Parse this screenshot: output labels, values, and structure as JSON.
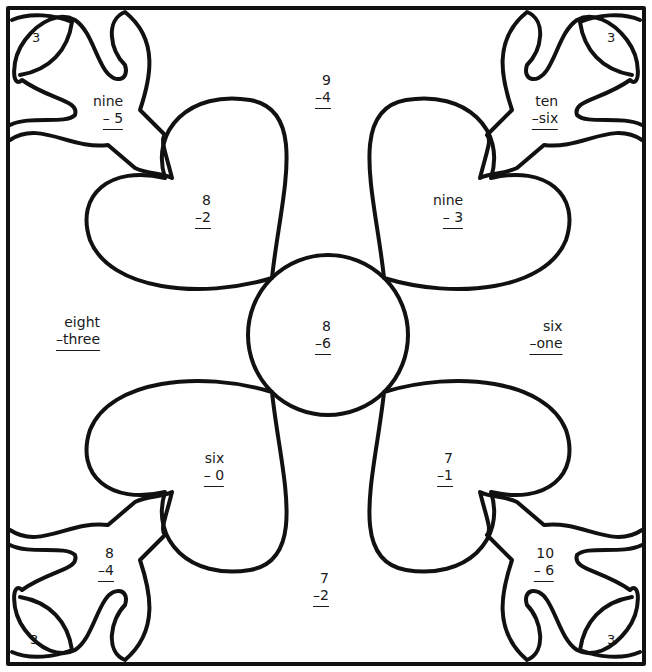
{
  "worksheet": {
    "corner_labels": [
      "3",
      "3",
      "3",
      "3"
    ],
    "problems": {
      "top": {
        "top": "9",
        "bottom": "–4"
      },
      "top_left_heart": {
        "top": "8",
        "bottom": "–2"
      },
      "top_right_heart": {
        "top": "nine",
        "bottom": "–  3"
      },
      "center": {
        "top": "8",
        "bottom": "–6"
      },
      "left": {
        "top": "eight",
        "bottom": "–three"
      },
      "right": {
        "top": "six",
        "bottom": "–one"
      },
      "bottom_left_heart": {
        "top": "six",
        "bottom": "– 0"
      },
      "bottom_right_heart": {
        "top": "7",
        "bottom": "–1"
      },
      "bottom": {
        "top": "7",
        "bottom": "–2"
      },
      "corner_tl": {
        "top": "nine",
        "bottom": "–  5"
      },
      "corner_tr": {
        "top": "ten",
        "bottom": "–six"
      },
      "corner_bl": {
        "top": "8",
        "bottom": "–4"
      },
      "corner_br": {
        "top": "10",
        "bottom": "–  6"
      }
    },
    "line_color": "#111111"
  }
}
